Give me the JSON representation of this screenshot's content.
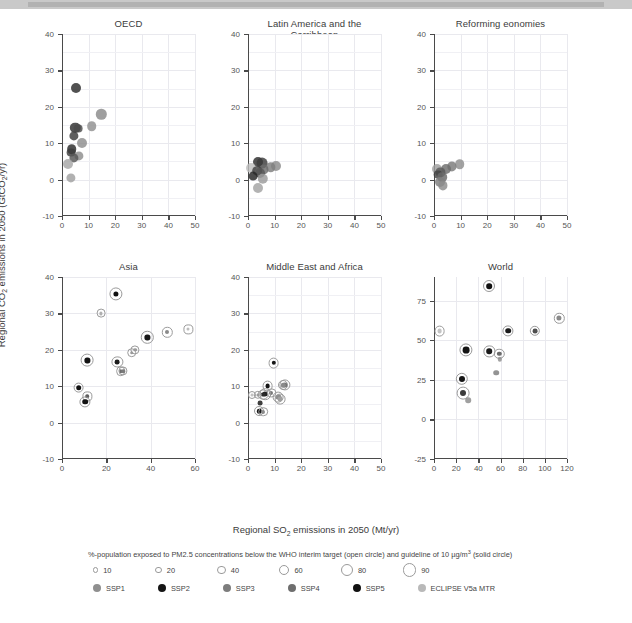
{
  "figure": {
    "xlabel": "Regional SO2 emissions in 2050 (Mt/yr)",
    "ylabel": "Regional CO2 emissions in 2050 (GtCO2/yr)"
  },
  "legend": {
    "size_caption": "%-population exposed to PM2.5 concentrations below the WHO interim target (open circle) and guideline of 10 µg/m³ (solid circle)",
    "size_items": [
      {
        "label": "10",
        "r": 1.6
      },
      {
        "label": "20",
        "r": 2.4
      },
      {
        "label": "40",
        "r": 3.4
      },
      {
        "label": "60",
        "r": 4.2
      },
      {
        "label": "80",
        "r": 5.0
      },
      {
        "label": "90",
        "r": 5.6
      }
    ],
    "scenario_caption": "Scenarios (SSP markers indicate baselines and 4.5 and 2.6 W/m2 mitigation scenarios, moving from top-right to bottom left)",
    "scenarios": [
      {
        "label": "SSP1",
        "color": "#8f8f8f"
      },
      {
        "label": "SSP2",
        "color": "#151515"
      },
      {
        "label": "SSP3",
        "color": "#7d7d7d"
      },
      {
        "label": "SSP4",
        "color": "#6e6e6e"
      },
      {
        "label": "SSP5",
        "color": "#111111"
      },
      {
        "label": "ECLIPSE V5a MTR",
        "color": "#b9b9b9"
      }
    ]
  },
  "chart_data": [
    {
      "type": "scatter",
      "title": "OECD",
      "xlabel": "Regional SO2 emissions in 2050 (Mt/yr)",
      "ylabel": "Regional CO2 emissions in 2050 (GtCO2/yr)",
      "xlim": [
        0,
        50
      ],
      "ylim": [
        -10,
        40
      ],
      "xticks": [
        0,
        10,
        20,
        30,
        40,
        50
      ],
      "yticks": [
        -10,
        0,
        10,
        20,
        30,
        40
      ],
      "grid": true,
      "points": [
        {
          "x": 5.4,
          "y": 25.1,
          "r": 5.0,
          "color": "#2b2b2b",
          "ring": false
        },
        {
          "x": 14.8,
          "y": 17.9,
          "r": 5.2,
          "color": "#8a8a8a",
          "ring": false
        },
        {
          "x": 11.1,
          "y": 14.6,
          "r": 4.8,
          "color": "#909090",
          "ring": false
        },
        {
          "x": 5.0,
          "y": 14.2,
          "r": 5.2,
          "color": "#2f2f2f",
          "ring": false
        },
        {
          "x": 6.2,
          "y": 14.0,
          "r": 4.4,
          "color": "#4a4a4a",
          "ring": false
        },
        {
          "x": 4.6,
          "y": 12.0,
          "r": 4.6,
          "color": "#3a3a3a",
          "ring": false
        },
        {
          "x": 7.4,
          "y": 10.0,
          "r": 5.0,
          "color": "#8d8d8d",
          "ring": false
        },
        {
          "x": 3.6,
          "y": 8.4,
          "r": 4.8,
          "color": "#2a2a2a",
          "ring": false
        },
        {
          "x": 3.4,
          "y": 7.4,
          "r": 4.4,
          "color": "#3d3d3d",
          "ring": false
        },
        {
          "x": 6.4,
          "y": 6.6,
          "r": 4.6,
          "color": "#8d8d8d",
          "ring": false
        },
        {
          "x": 4.6,
          "y": 6.0,
          "r": 4.6,
          "color": "#555555",
          "ring": false
        },
        {
          "x": 2.4,
          "y": 4.4,
          "r": 5.0,
          "color": "#a6a6a6",
          "ring": false
        },
        {
          "x": 3.2,
          "y": 0.4,
          "r": 4.6,
          "color": "#a0a0a0",
          "ring": false
        }
      ]
    },
    {
      "type": "scatter",
      "title": "Latin America and the Carribbean",
      "xlim": [
        0,
        50
      ],
      "ylim": [
        -10,
        40
      ],
      "xticks": [
        0,
        10,
        20,
        30,
        40,
        50
      ],
      "yticks": [
        -10,
        0,
        10,
        20,
        30,
        40
      ],
      "grid": true,
      "points": [
        {
          "x": 3.6,
          "y": 4.8,
          "r": 5.0,
          "color": "#2c2c2c",
          "ring": false
        },
        {
          "x": 5.4,
          "y": 4.6,
          "r": 5.4,
          "color": "#3a3a3a",
          "ring": false
        },
        {
          "x": 10.6,
          "y": 3.6,
          "r": 5.0,
          "color": "#8b8b8b",
          "ring": false
        },
        {
          "x": 8.6,
          "y": 3.4,
          "r": 4.8,
          "color": "#7e7e7e",
          "ring": false
        },
        {
          "x": 1.2,
          "y": 3.2,
          "r": 5.0,
          "color": "#bdbdbd",
          "ring": false
        },
        {
          "x": 6.0,
          "y": 2.8,
          "r": 4.6,
          "color": "#6b6b6b",
          "ring": false
        },
        {
          "x": 3.4,
          "y": 2.4,
          "r": 4.8,
          "color": "#404040",
          "ring": false
        },
        {
          "x": 4.6,
          "y": 1.8,
          "r": 5.0,
          "color": "#585858",
          "ring": false
        },
        {
          "x": 2.0,
          "y": 1.0,
          "r": 4.4,
          "color": "#232323",
          "ring": false
        },
        {
          "x": 5.6,
          "y": 0.2,
          "r": 5.2,
          "color": "#9a9a9a",
          "ring": false
        },
        {
          "x": 3.8,
          "y": -2.4,
          "r": 5.0,
          "color": "#a2a2a2",
          "ring": false
        }
      ]
    },
    {
      "type": "scatter",
      "title": "Reforming eonomies",
      "xlim": [
        0,
        50
      ],
      "ylim": [
        -10,
        40
      ],
      "xticks": [
        0,
        10,
        20,
        30,
        40,
        50
      ],
      "yticks": [
        -10,
        0,
        10,
        20,
        30,
        40
      ],
      "grid": true,
      "points": [
        {
          "x": 9.6,
          "y": 4.2,
          "r": 4.8,
          "color": "#8d8d8d",
          "ring": false
        },
        {
          "x": 6.6,
          "y": 3.6,
          "r": 4.6,
          "color": "#7a7a7a",
          "ring": false
        },
        {
          "x": 4.6,
          "y": 3.0,
          "r": 5.0,
          "color": "#6d6d6d",
          "ring": false
        },
        {
          "x": 1.2,
          "y": 2.8,
          "r": 5.0,
          "color": "#9f9f9f",
          "ring": false
        },
        {
          "x": 2.4,
          "y": 2.0,
          "r": 4.6,
          "color": "#5a5a5a",
          "ring": false
        },
        {
          "x": 1.6,
          "y": 1.4,
          "r": 4.4,
          "color": "#444444",
          "ring": false
        },
        {
          "x": 3.0,
          "y": 0.6,
          "r": 4.8,
          "color": "#6a6a6a",
          "ring": false
        },
        {
          "x": 2.2,
          "y": -0.6,
          "r": 5.0,
          "color": "#7f7f7f",
          "ring": false
        },
        {
          "x": 3.2,
          "y": -1.6,
          "r": 4.6,
          "color": "#8b8b8b",
          "ring": false
        }
      ]
    },
    {
      "type": "scatter",
      "title": "Asia",
      "xlim": [
        0,
        60
      ],
      "ylim": [
        -10,
        40
      ],
      "xticks": [
        0,
        20,
        40,
        60
      ],
      "yticks": [
        -10,
        0,
        10,
        20,
        30,
        40
      ],
      "grid": true,
      "points": [
        {
          "x": 24.5,
          "y": 35.4,
          "r": 2.6,
          "color": "#111111",
          "ring": true,
          "ringr": 5.6
        },
        {
          "x": 17.5,
          "y": 30.0,
          "r": 1.6,
          "color": "#b0b0b0",
          "ring": true,
          "ringr": 3.4
        },
        {
          "x": 57.0,
          "y": 25.6,
          "r": 1.5,
          "color": "#bdbdbd",
          "ring": true,
          "ringr": 3.6
        },
        {
          "x": 47.5,
          "y": 24.8,
          "r": 2.0,
          "color": "#8a8a8a",
          "ring": true,
          "ringr": 4.2
        },
        {
          "x": 38.5,
          "y": 23.4,
          "r": 2.6,
          "color": "#1a1a1a",
          "ring": true,
          "ringr": 5.2
        },
        {
          "x": 33.0,
          "y": 20.0,
          "r": 1.8,
          "color": "#9c9c9c",
          "ring": true,
          "ringr": 3.6
        },
        {
          "x": 31.5,
          "y": 19.2,
          "r": 1.8,
          "color": "#9a9a9a",
          "ring": true,
          "ringr": 3.8
        },
        {
          "x": 11.5,
          "y": 17.1,
          "r": 2.6,
          "color": "#141414",
          "ring": true,
          "ringr": 5.4
        },
        {
          "x": 25.0,
          "y": 16.6,
          "r": 2.4,
          "color": "#1c1c1c",
          "ring": true,
          "ringr": 4.6
        },
        {
          "x": 26.5,
          "y": 14.2,
          "r": 1.8,
          "color": "#6e6e6e",
          "ring": true,
          "ringr": 3.8
        },
        {
          "x": 27.5,
          "y": 14.1,
          "r": 1.8,
          "color": "#7a7a7a",
          "ring": true,
          "ringr": 3.6
        },
        {
          "x": 7.5,
          "y": 9.6,
          "r": 2.8,
          "color": "#111111",
          "ring": true,
          "ringr": 4.4
        },
        {
          "x": 11.5,
          "y": 7.2,
          "r": 1.8,
          "color": "#5e5e5e",
          "ring": true,
          "ringr": 3.6
        },
        {
          "x": 10.5,
          "y": 5.7,
          "r": 2.8,
          "color": "#131313",
          "ring": true,
          "ringr": 4.6
        }
      ]
    },
    {
      "type": "scatter",
      "title": "Middle East and Africa",
      "xlim": [
        0,
        50
      ],
      "ylim": [
        -10,
        40
      ],
      "xticks": [
        0,
        10,
        20,
        30,
        40,
        50
      ],
      "yticks": [
        -10,
        0,
        10,
        20,
        30,
        40
      ],
      "grid": true,
      "points": [
        {
          "x": 9.6,
          "y": 16.4,
          "r": 2.2,
          "color": "#151515",
          "ring": true,
          "ringr": 4.4
        },
        {
          "x": 14.0,
          "y": 10.4,
          "r": 2.6,
          "color": "#6e6e6e",
          "ring": true,
          "ringr": 4.6
        },
        {
          "x": 13.2,
          "y": 10.2,
          "r": 2.2,
          "color": "#8a8a8a",
          "ring": true,
          "ringr": 4.0
        },
        {
          "x": 7.4,
          "y": 10.1,
          "r": 2.4,
          "color": "#151515",
          "ring": true,
          "ringr": 4.4
        },
        {
          "x": 8.8,
          "y": 8.2,
          "r": 2.0,
          "color": "#787878",
          "ring": true,
          "ringr": 3.6
        },
        {
          "x": 6.4,
          "y": 7.8,
          "r": 2.6,
          "color": "#202020",
          "ring": true,
          "ringr": 4.8
        },
        {
          "x": 5.6,
          "y": 7.7,
          "r": 2.4,
          "color": "#2a2a2a",
          "ring": true,
          "ringr": 4.4
        },
        {
          "x": 3.6,
          "y": 7.7,
          "r": 1.6,
          "color": "#9b9b9b",
          "ring": true,
          "ringr": 3.2
        },
        {
          "x": 1.4,
          "y": 7.6,
          "r": 1.4,
          "color": "#c2c2c2",
          "ring": true,
          "ringr": 3.0
        },
        {
          "x": 11.4,
          "y": 7.0,
          "r": 2.6,
          "color": "#8f8f8f",
          "ring": true,
          "ringr": 4.4
        },
        {
          "x": 12.0,
          "y": 6.4,
          "r": 2.4,
          "color": "#a0a0a0",
          "ring": true,
          "ringr": 4.4
        },
        {
          "x": 4.6,
          "y": 5.4,
          "r": 2.4,
          "color": "#131313",
          "ring": false
        },
        {
          "x": 4.2,
          "y": 3.1,
          "r": 2.2,
          "color": "#181818",
          "ring": true,
          "ringr": 4.0
        },
        {
          "x": 5.8,
          "y": 3.0,
          "r": 2.0,
          "color": "#8c8c8c",
          "ring": true,
          "ringr": 3.8
        }
      ]
    },
    {
      "type": "scatter",
      "title": "World",
      "xlim": [
        0,
        120
      ],
      "ylim": [
        -25,
        90
      ],
      "xticks": [
        0,
        20,
        40,
        60,
        80,
        100,
        120
      ],
      "yticks": [
        -25,
        0,
        25,
        50,
        75
      ],
      "grid": true,
      "points": [
        {
          "x": 50.0,
          "y": 84.0,
          "r": 2.8,
          "color": "#111111",
          "ring": true,
          "ringr": 5.0
        },
        {
          "x": 113.0,
          "y": 64.0,
          "r": 2.6,
          "color": "#8a8a8a",
          "ring": true,
          "ringr": 4.2
        },
        {
          "x": 67.0,
          "y": 56.0,
          "r": 2.8,
          "color": "#1b1b1b",
          "ring": true,
          "ringr": 4.6
        },
        {
          "x": 91.0,
          "y": 56.0,
          "r": 2.4,
          "color": "#4f4f4f",
          "ring": true,
          "ringr": 4.2
        },
        {
          "x": 5.0,
          "y": 56.0,
          "r": 2.4,
          "color": "#c4c4c4",
          "ring": true,
          "ringr": 4.4
        },
        {
          "x": 29.0,
          "y": 43.8,
          "r": 3.4,
          "color": "#141414",
          "ring": true,
          "ringr": 5.6
        },
        {
          "x": 50.0,
          "y": 43.0,
          "r": 2.8,
          "color": "#1a1a1a",
          "ring": true,
          "ringr": 4.6
        },
        {
          "x": 59.0,
          "y": 41.5,
          "r": 2.2,
          "color": "#6a6a6a",
          "ring": true,
          "ringr": 4.2
        },
        {
          "x": 59.5,
          "y": 38.0,
          "r": 2.2,
          "color": "#8d8d8d",
          "ring": false
        },
        {
          "x": 56.0,
          "y": 29.5,
          "r": 2.8,
          "color": "#7b7b7b",
          "ring": false
        },
        {
          "x": 25.0,
          "y": 25.5,
          "r": 3.0,
          "color": "#151515",
          "ring": true,
          "ringr": 5.2
        },
        {
          "x": 26.0,
          "y": 16.5,
          "r": 3.0,
          "color": "#3c3c3c",
          "ring": true,
          "ringr": 5.4
        },
        {
          "x": 31.0,
          "y": 12.0,
          "r": 2.8,
          "color": "#8b8b8b",
          "ring": false
        }
      ]
    }
  ]
}
